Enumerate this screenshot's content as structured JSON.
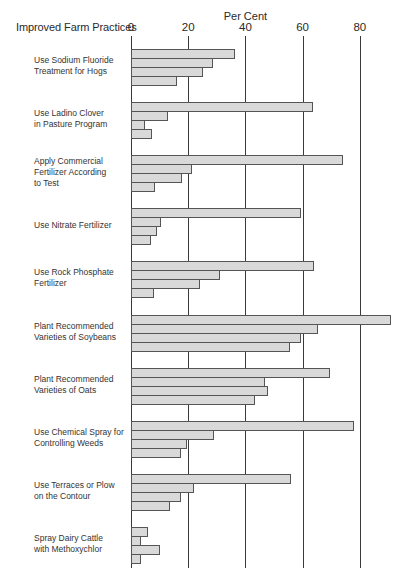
{
  "chart_data": {
    "type": "bar",
    "orientation": "horizontal",
    "title": "",
    "category_axis_title": "Improved Farm Practices",
    "xlabel": "Per Cent",
    "ylabel": "",
    "xlim": [
      0,
      90
    ],
    "x_ticks": [
      0,
      20,
      40,
      60,
      80
    ],
    "grid": true,
    "legend": null,
    "bars_per_group": 4,
    "categories": [
      "Use Sodium Fluoride Treatment for Hogs",
      "Use Ladino Clover in Pasture Program",
      "Apply Commercial Fertilizer According to Test",
      "Use Nitrate Fertilizer",
      "Use Rock Phosphate Fertilizer",
      "Plant Recommended Varieties of Soybeans",
      "Plant Recommended Varieties of Oats",
      "Use Chemical Spray for Controlling Weeds",
      "Use Terraces or Plow on the Contour",
      "Spray Dairy Cattle with Methoxychlor"
    ],
    "category_label_lines": [
      [
        "Use Sodium Fluoride",
        "Treatment for Hogs"
      ],
      [
        "Use Ladino Clover",
        "in Pasture Program"
      ],
      [
        "Apply Commercial",
        "Fertilizer According",
        "to Test"
      ],
      [
        "Use Nitrate Fertilizer"
      ],
      [
        "Use Rock Phosphate",
        "Fertilizer"
      ],
      [
        "Plant Recommended",
        "Varieties of Soybeans"
      ],
      [
        "Plant Recommended",
        "Varieties of Oats"
      ],
      [
        "Use Chemical Spray for",
        "Controlling Weeds"
      ],
      [
        "Use Terraces or Plow",
        "on the Contour"
      ],
      [
        "Spray Dairy Cattle",
        "with Methoxychlor"
      ]
    ],
    "series": [
      {
        "name": "Bar 1",
        "values": [
          36.5,
          63.5,
          74,
          59.5,
          64,
          91,
          69.5,
          78,
          56,
          6
        ]
      },
      {
        "name": "Bar 2",
        "values": [
          28.5,
          13,
          21.5,
          10.5,
          31,
          65.5,
          47,
          29,
          22,
          3.5
        ]
      },
      {
        "name": "Bar 3",
        "values": [
          25,
          5,
          18,
          9,
          24,
          59.5,
          48,
          19.5,
          17.5,
          10
        ]
      },
      {
        "name": "Bar 4",
        "values": [
          16,
          7.5,
          8.5,
          7,
          8,
          55.5,
          43.5,
          17.5,
          13.5,
          3.5
        ]
      }
    ],
    "colors": {
      "bar_fill": "#d9d9d9",
      "bar_border": "#555555",
      "grid": "#3a3a3a"
    }
  }
}
